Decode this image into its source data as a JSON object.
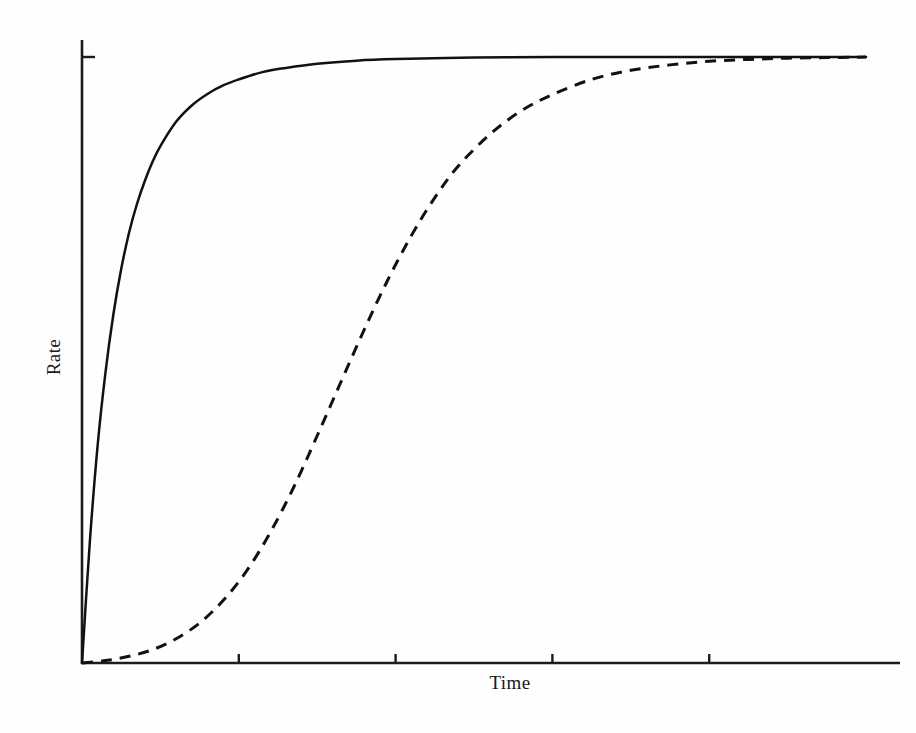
{
  "figure": {
    "background_color": "#fefefe",
    "ink_color": "#111111"
  },
  "chart_data": {
    "type": "line",
    "title": "",
    "subtitle": "",
    "xlabel": "Time",
    "ylabel": "Rate",
    "xlim": [
      0,
      100
    ],
    "ylim": [
      0,
      1.08
    ],
    "grid": false,
    "legend": null,
    "legend_position": "none",
    "x_tick_labels": [],
    "y_tick_labels": [],
    "x_ticks": [
      20,
      40,
      60,
      80
    ],
    "y_ticks": [
      1.0
    ],
    "annotations": [],
    "axis_style": {
      "spines": [
        "left",
        "bottom"
      ],
      "tick_direction": "out",
      "tick_length_px": 8
    },
    "series": [
      {
        "name": "hyperbolic-rise",
        "style": "solid",
        "color": "#111111",
        "linewidth": 2.5,
        "description": "Rapid hyperbolic saturation reaching plateau early",
        "x": [
          0,
          1,
          2,
          3,
          4,
          5,
          6,
          7,
          8,
          9,
          10,
          12,
          14,
          16,
          18,
          20,
          23,
          26,
          30,
          35,
          40,
          50,
          60,
          70,
          80,
          90,
          100
        ],
        "y": [
          0,
          0.2,
          0.36,
          0.48,
          0.575,
          0.65,
          0.71,
          0.757,
          0.795,
          0.827,
          0.853,
          0.893,
          0.92,
          0.939,
          0.953,
          0.963,
          0.975,
          0.982,
          0.989,
          0.994,
          0.9965,
          0.999,
          0.9998,
          1.0,
          1.0,
          1.0,
          1.0
        ]
      },
      {
        "name": "sigmoidal-rise",
        "style": "dashed",
        "color": "#111111",
        "linewidth": 3.0,
        "dash_pattern": [
          11,
          8
        ],
        "description": "Sigmoidal curve with initial lag phase, same final plateau",
        "x": [
          0,
          3,
          6,
          9,
          12,
          15,
          18,
          21,
          24,
          27,
          30,
          33,
          36,
          39,
          42,
          45,
          48,
          52,
          56,
          60,
          65,
          70,
          75,
          80,
          85,
          90,
          95,
          100
        ],
        "y": [
          0,
          0.004,
          0.011,
          0.022,
          0.04,
          0.066,
          0.103,
          0.152,
          0.215,
          0.29,
          0.375,
          0.463,
          0.55,
          0.632,
          0.705,
          0.768,
          0.82,
          0.872,
          0.911,
          0.938,
          0.963,
          0.978,
          0.987,
          0.993,
          0.996,
          0.998,
          0.999,
          1.0
        ]
      }
    ]
  },
  "geometry": {
    "origin_px": {
      "x": 82,
      "y": 663
    },
    "x_axis_end_px": {
      "x": 900,
      "y": 663
    },
    "y_axis_top_px": {
      "x": 82,
      "y": 40
    },
    "plateau_y_px": 57,
    "plot_right_px": 866
  }
}
